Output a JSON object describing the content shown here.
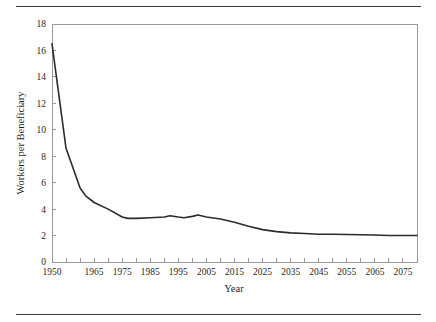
{
  "figure": {
    "has_top_rule": true,
    "has_bottom_rule": true,
    "background_color": "#ffffff",
    "rule_color": "#3a3a3a"
  },
  "chart_data": {
    "type": "line",
    "title": "",
    "xlabel": "Year",
    "ylabel": "Workers per Beneficiary",
    "xlim": [
      1950,
      2080
    ],
    "ylim": [
      0,
      18
    ],
    "grid": false,
    "legend": null,
    "line_color": "#2b2b2b",
    "axis_color": "#9a9a9a",
    "xticks": [
      1950,
      1955,
      1960,
      1965,
      1970,
      1975,
      1980,
      1985,
      1990,
      1995,
      2000,
      2005,
      2010,
      2015,
      2020,
      2025,
      2030,
      2035,
      2040,
      2045,
      2050,
      2055,
      2060,
      2065,
      2070,
      2075,
      2080
    ],
    "xtick_labels": [
      "1950",
      "",
      "",
      "1965",
      "",
      "1975",
      "",
      "1985",
      "",
      "1995",
      "",
      "2005",
      "",
      "2015",
      "",
      "2025",
      "",
      "2035",
      "",
      "2045",
      "",
      "2055",
      "",
      "2065",
      "",
      "2075",
      ""
    ],
    "yticks": [
      0,
      2,
      4,
      6,
      8,
      10,
      12,
      14,
      16,
      18
    ],
    "ytick_labels": [
      "0",
      "2",
      "4",
      "6",
      "8",
      "10",
      "12",
      "14",
      "16",
      "18"
    ],
    "series": [
      {
        "name": "Workers per Beneficiary",
        "x": [
          1950,
          1955,
          1960,
          1962,
          1965,
          1970,
          1975,
          1977,
          1980,
          1985,
          1990,
          1992,
          1995,
          1997,
          2000,
          2002,
          2005,
          2010,
          2015,
          2020,
          2025,
          2030,
          2035,
          2040,
          2045,
          2050,
          2055,
          2060,
          2065,
          2070,
          2075,
          2080
        ],
        "values": [
          16.5,
          8.6,
          5.6,
          5.0,
          4.5,
          4.0,
          3.4,
          3.3,
          3.3,
          3.35,
          3.4,
          3.5,
          3.4,
          3.35,
          3.45,
          3.55,
          3.4,
          3.25,
          3.0,
          2.7,
          2.45,
          2.3,
          2.2,
          2.15,
          2.1,
          2.1,
          2.08,
          2.06,
          2.04,
          2.0,
          2.0,
          2.0
        ]
      }
    ]
  }
}
